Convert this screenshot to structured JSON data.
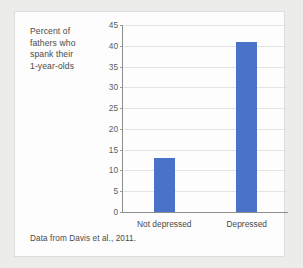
{
  "card": {
    "y_axis_caption_lines": [
      "Percent of",
      "fathers who",
      "spank their",
      "1-year-olds"
    ],
    "source_note": "Data from Davis et al., 2011."
  },
  "colors": {
    "bar": "#4a72c8",
    "grid": "#e4e4e2",
    "axis": "#8d8d8b",
    "text": "#4a4a4a",
    "card_background": "#fdfdfd",
    "page_background": "#ececeb"
  },
  "chart_data": {
    "type": "bar",
    "title": "",
    "xlabel": "",
    "ylabel": "Percent of fathers who spank their 1-year-olds",
    "categories": [
      "Not depressed",
      "Depressed"
    ],
    "values": [
      13,
      41
    ],
    "ylim": [
      0,
      45
    ],
    "ytick_step": 5,
    "yticks": [
      0,
      5,
      10,
      15,
      20,
      25,
      30,
      35,
      40,
      45
    ],
    "ytick_labels": [
      "0",
      "5",
      "10",
      "15",
      "20",
      "25",
      "30",
      "35",
      "40",
      "45"
    ],
    "grid": "horizontal",
    "legend": "none",
    "series": [
      {
        "name": "Percent who spank",
        "values": [
          13,
          41
        ],
        "color": "#4a72c8"
      }
    ]
  }
}
